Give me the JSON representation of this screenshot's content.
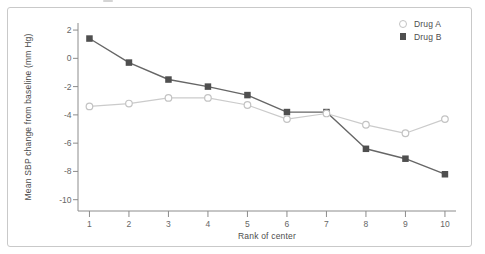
{
  "figure": {
    "background": "#ffffff",
    "border_color": "#c9c9c9"
  },
  "chart_data": {
    "type": "line",
    "title": "",
    "xlabel": "Rank of center",
    "ylabel": "Mean SBP change from baseline (mm Hg)",
    "x": [
      1,
      2,
      3,
      4,
      5,
      6,
      7,
      8,
      9,
      10
    ],
    "xtick_labels": [
      "1",
      "2",
      "3",
      "4",
      "5",
      "6",
      "7",
      "8",
      "9",
      "10"
    ],
    "yticks": [
      2,
      0,
      -2,
      -4,
      -6,
      -8,
      -10
    ],
    "xlim": [
      0.71,
      10.28
    ],
    "ylim": [
      -10.8,
      2.5
    ],
    "grid": false,
    "legend_position": "top-right-inside",
    "axis_color": "#8c8c8c",
    "tick_label_color": "#666666",
    "series": [
      {
        "name": "Drug A",
        "marker": "open-circle",
        "line_color": "#cbcbcb",
        "marker_color": "#c3c3c3",
        "marker_fill": "#ffffff",
        "values": [
          -3.4,
          -3.2,
          -2.8,
          -2.8,
          -3.3,
          -4.3,
          -3.9,
          -4.7,
          -5.3,
          -4.3
        ]
      },
      {
        "name": "Drug B",
        "marker": "filled-square",
        "line_color": "#666666",
        "marker_color": "#4f4f4f",
        "values": [
          1.4,
          -0.3,
          -1.5,
          -2.0,
          -2.6,
          -3.8,
          -3.8,
          -6.4,
          -7.1,
          -8.2
        ]
      }
    ]
  }
}
